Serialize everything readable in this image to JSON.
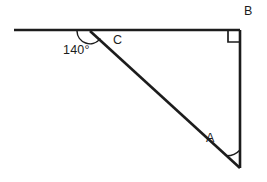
{
  "figure": {
    "kind": "geometry-diagram",
    "background_color": "#ffffff",
    "stroke_color": "#1c1c1c"
  },
  "labels": {
    "vertex_a": "A",
    "vertex_b": "B",
    "vertex_c": "C",
    "exterior_angle": "140°"
  },
  "geometry": {
    "points": {
      "ray_left_end": {
        "x": 14,
        "y": 30
      },
      "vertex_c": {
        "x": 90,
        "y": 31
      },
      "vertex_b": {
        "x": 240,
        "y": 30
      },
      "vertex_a": {
        "x": 240,
        "y": 168
      }
    },
    "segments": [
      {
        "name": "horizontal-ray",
        "from": "ray_left_end",
        "to": "vertex_b"
      },
      {
        "name": "vertical-side-ab",
        "from": "vertex_b",
        "to": "vertex_a"
      },
      {
        "name": "hypotenuse-ca",
        "from": "vertex_c",
        "to": "vertex_a"
      }
    ],
    "angle_marks": [
      {
        "name": "angle-c-arc",
        "at": "vertex_c",
        "measure": "140°",
        "radius": 13
      },
      {
        "name": "angle-a-arc",
        "at": "vertex_a",
        "measure": "",
        "radius": 18
      },
      {
        "name": "right-angle-square-b",
        "at": "vertex_b",
        "measure": "90°",
        "size": 10
      }
    ]
  }
}
